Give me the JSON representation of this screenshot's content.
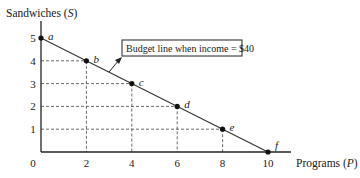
{
  "chart_data": {
    "type": "line",
    "title": "",
    "xlabel": "Programs (P)",
    "ylabel": "Sandwiches (S)",
    "xlabel_parts": {
      "text": "Programs (",
      "var": "P",
      "close": ")"
    },
    "ylabel_parts": {
      "text": "Sandwiches (",
      "var": "S",
      "close": ")"
    },
    "xlim": [
      0,
      10
    ],
    "ylim": [
      0,
      5
    ],
    "x_ticks": [
      "0",
      "2",
      "4",
      "6",
      "8",
      "10"
    ],
    "y_ticks": [
      "1",
      "2",
      "3",
      "4",
      "5"
    ],
    "grid": "dashed guide lines from each labeled point to both axes",
    "series": [
      {
        "name": "Budget line when income = $40",
        "points": [
          {
            "label": "a",
            "x": 0,
            "y": 5
          },
          {
            "label": "b",
            "x": 2,
            "y": 4
          },
          {
            "label": "c",
            "x": 4,
            "y": 3
          },
          {
            "label": "d",
            "x": 6,
            "y": 2
          },
          {
            "label": "e",
            "x": 8,
            "y": 1
          },
          {
            "label": "f",
            "x": 10,
            "y": 0
          }
        ]
      }
    ],
    "annotations": [
      {
        "text": "Budget line when income = $40",
        "boxed": true,
        "arrow_to": "budget line between b and c"
      }
    ],
    "legend": "none"
  }
}
